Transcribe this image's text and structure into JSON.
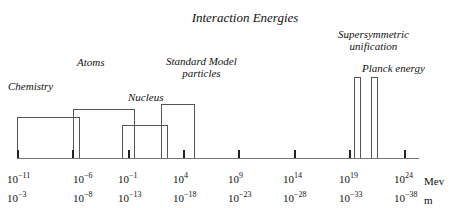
{
  "title": "Interaction Energies",
  "labels": {
    "chemistry": "Chemistry",
    "atoms": "Atoms",
    "nucleus": "Nucleus",
    "standard_model_1": "Standard Model",
    "standard_model_2": "particles",
    "susy_1": "Supersymmetric",
    "susy_2": "unification",
    "planck": "Planck energy"
  },
  "axis": {
    "energy_unit": "Mev",
    "length_unit": "m",
    "energy_ticks": [
      {
        "base": "10",
        "exp": "−11"
      },
      {
        "base": "10",
        "exp": "−6"
      },
      {
        "base": "10",
        "exp": "−1"
      },
      {
        "base": "10",
        "exp": "4"
      },
      {
        "base": "10",
        "exp": "9"
      },
      {
        "base": "10",
        "exp": "14"
      },
      {
        "base": "10",
        "exp": "19"
      },
      {
        "base": "10",
        "exp": "24"
      }
    ],
    "length_ticks": [
      {
        "base": "10",
        "exp": "−3"
      },
      {
        "base": "10",
        "exp": "−8"
      },
      {
        "base": "10",
        "exp": "−13"
      },
      {
        "base": "10",
        "exp": "−18"
      },
      {
        "base": "10",
        "exp": "−23"
      },
      {
        "base": "10",
        "exp": "−28"
      },
      {
        "base": "10",
        "exp": "−33"
      },
      {
        "base": "10",
        "exp": "−38"
      }
    ]
  },
  "ranges": [
    {
      "name": "Chemistry",
      "from_exp": -11,
      "to_exp": -5.5
    },
    {
      "name": "Atoms",
      "from_exp": -6,
      "to_exp": -0.5
    },
    {
      "name": "Nucleus",
      "from_exp": -1.5,
      "to_exp": 2.5
    },
    {
      "name": "Standard Model particles",
      "from_exp": 2,
      "to_exp": 5
    },
    {
      "name": "Supersymmetric unification",
      "from_exp": 19.3,
      "to_exp": 19.9
    },
    {
      "name": "Planck energy",
      "from_exp": 20.9,
      "to_exp": 21.5
    }
  ]
}
